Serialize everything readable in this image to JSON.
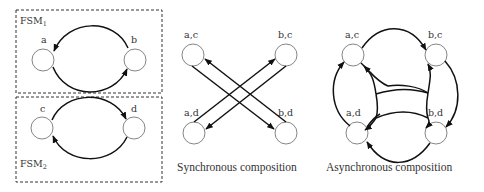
{
  "fsm1": {
    "title": "FSM",
    "subscript": "1",
    "states": [
      "a",
      "b"
    ],
    "transitions": [
      [
        "b",
        "a"
      ],
      [
        "a",
        "b"
      ]
    ]
  },
  "fsm2": {
    "title": "FSM",
    "subscript": "2",
    "states": [
      "c",
      "d"
    ],
    "transitions": [
      [
        "c",
        "d"
      ],
      [
        "d",
        "c"
      ]
    ]
  },
  "synchronous": {
    "caption": "Synchronous composition",
    "states": [
      "a,c",
      "b,c",
      "a,d",
      "b,d"
    ],
    "transitions": [
      [
        "a,c",
        "b,d"
      ],
      [
        "b,d",
        "a,c"
      ],
      [
        "a,d",
        "b,c"
      ],
      [
        "b,c",
        "a,d"
      ]
    ]
  },
  "asynchronous": {
    "caption": "Asynchronous composition",
    "states": [
      "a,c",
      "b,c",
      "a,d",
      "b,d"
    ],
    "transitions": [
      [
        "a,c",
        "b,c"
      ],
      [
        "b,c",
        "a,c"
      ],
      [
        "b,c",
        "b,d"
      ],
      [
        "b,d",
        "b,c"
      ],
      [
        "a,d",
        "b,d"
      ],
      [
        "b,d",
        "a,d"
      ],
      [
        "a,d",
        "a,c"
      ],
      [
        "a,c",
        "a,d"
      ]
    ]
  }
}
